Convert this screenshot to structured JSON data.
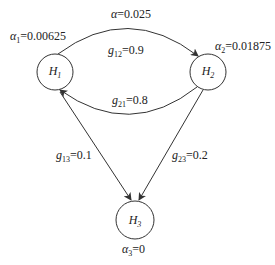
{
  "diagram": {
    "nodes": [
      {
        "id": "H1",
        "symbol": "H",
        "sub": "1",
        "alpha_symbol": "α",
        "alpha_sub": "1",
        "alpha_value": "=0.00625"
      },
      {
        "id": "H2",
        "symbol": "H",
        "sub": "2",
        "alpha_symbol": "α",
        "alpha_sub": "2",
        "alpha_value": "=0.01875"
      },
      {
        "id": "H3",
        "symbol": "H",
        "sub": "3",
        "alpha_symbol": "α",
        "alpha_sub": "3",
        "alpha_value": "=0"
      }
    ],
    "global_alpha": {
      "symbol": "α",
      "value": "=0.025"
    },
    "edges": [
      {
        "from": "H1",
        "to": "H2",
        "symbol": "g",
        "sub": "12",
        "value": "=0.9"
      },
      {
        "from": "H2",
        "to": "H1",
        "symbol": "g",
        "sub": "21",
        "value": "=0.8"
      },
      {
        "from": "H1",
        "to": "H3",
        "symbol": "g",
        "sub": "13",
        "value": "=0.1"
      },
      {
        "from": "H2",
        "to": "H3",
        "symbol": "g",
        "sub": "23",
        "value": "=0.2"
      }
    ],
    "stroke_color": "#333333"
  }
}
